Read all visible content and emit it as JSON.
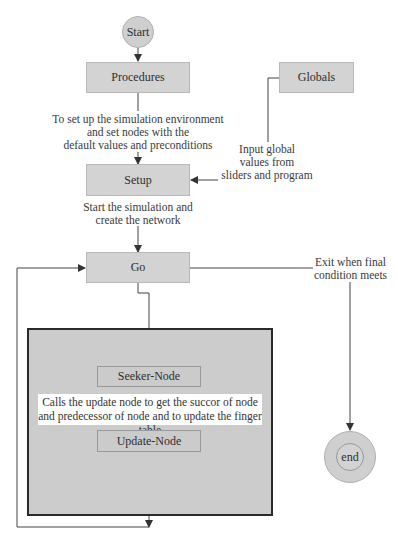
{
  "diagram": {
    "nodes": {
      "start": "Start",
      "procedures": "Procedures",
      "globals": "Globals",
      "setup": "Setup",
      "go": "Go",
      "seeker": "Seeker-Node",
      "update": "Update-Node",
      "end": "end"
    },
    "labels": {
      "procedures_to_setup": [
        "To set up the simulation environment",
        "and set nodes with the",
        "default values and preconditions"
      ],
      "globals_to_setup": [
        "Input global",
        "values from",
        "sliders and program"
      ],
      "setup_to_go": [
        "Start the simulation and",
        "create the network"
      ],
      "go_to_end": [
        "Exit when final",
        "condition meets"
      ],
      "seeker_to_update": [
        "Calls the update node to get the succor of node",
        "and predecessor of node and to update the finger table"
      ]
    },
    "colors": {
      "node_fill": "#d3d3d3",
      "group_fill": "#cccccc",
      "group_border": "#2a2a2a",
      "line": "#333333"
    }
  }
}
